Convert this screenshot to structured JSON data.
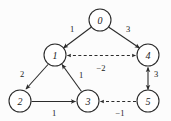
{
  "figure": {
    "type": "directed-weighted-graph",
    "width": 171,
    "height": 121,
    "background_color": "#fcfcfc",
    "stroke_color": "#2b2b2b",
    "text_color": "#1a1a1a"
  },
  "graph_data": {
    "type": "graph",
    "directed": true,
    "weighted": true,
    "nodes": [
      {
        "id": "0",
        "label": "0",
        "x": 100,
        "y": 20,
        "r": 11
      },
      {
        "id": "1",
        "label": "1",
        "x": 55,
        "y": 55,
        "r": 11
      },
      {
        "id": "4",
        "label": "4",
        "x": 148,
        "y": 55,
        "r": 11
      },
      {
        "id": "2",
        "label": "2",
        "x": 20,
        "y": 101,
        "r": 11
      },
      {
        "id": "3",
        "label": "3",
        "x": 88,
        "y": 101,
        "r": 11
      },
      {
        "id": "5",
        "label": "5",
        "x": 148,
        "y": 101,
        "r": 11
      }
    ],
    "edges": [
      {
        "from": "0",
        "to": "1",
        "weight": "1",
        "style": "solid",
        "arrows": "forward",
        "label_x": 72,
        "label_y": 29
      },
      {
        "from": "0",
        "to": "4",
        "weight": "3",
        "style": "solid",
        "arrows": "forward",
        "label_x": 128,
        "label_y": 29
      },
      {
        "from": "1",
        "to": "4",
        "weight": "−2",
        "style": "dashed",
        "arrows": "both",
        "label_x": 101,
        "label_y": 68
      },
      {
        "from": "1",
        "to": "2",
        "weight": "2",
        "style": "solid",
        "arrows": "forward",
        "label_x": 22,
        "label_y": 74
      },
      {
        "from": "3",
        "to": "1",
        "weight": "1",
        "style": "solid",
        "arrows": "forward",
        "label_x": 81,
        "label_y": 75
      },
      {
        "from": "2",
        "to": "3",
        "weight": "1",
        "style": "solid",
        "arrows": "forward",
        "label_x": 54,
        "label_y": 113
      },
      {
        "from": "4",
        "to": "5",
        "weight": "3",
        "style": "solid",
        "arrows": "both",
        "label_x": 155,
        "label_y": 74
      },
      {
        "from": "5",
        "to": "3",
        "weight": "−1",
        "style": "dashed",
        "arrows": "forward",
        "label_x": 120,
        "label_y": 113
      }
    ]
  },
  "node_labels": {
    "n0": "0",
    "n1": "1",
    "n4": "4",
    "n2": "2",
    "n3": "3",
    "n5": "5"
  },
  "edge_labels": {
    "e0_1": "1",
    "e0_4": "3",
    "e1_4": "−2",
    "e1_2": "2",
    "e3_1": "1",
    "e2_3": "1",
    "e4_5": "3",
    "e5_3": "−1"
  }
}
